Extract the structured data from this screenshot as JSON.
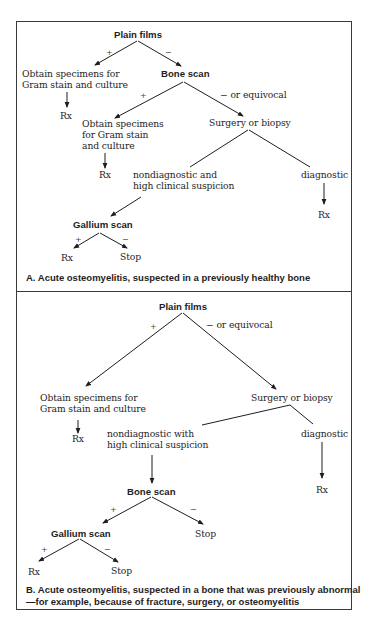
{
  "panel_a": {
    "root": "Plain films",
    "root_pos_label": "+",
    "root_neg_label": "−",
    "pos_result_line1": "Obtain specimens for",
    "pos_result_line2": "Gram stain and culture",
    "pos_rx": "Rx",
    "bone_scan": "Bone scan",
    "bone_pos_label": "+",
    "bone_neg_label": "−  or equivocal",
    "bone_pos_line1": "Obtain specimens",
    "bone_pos_line2": "for Gram stain",
    "bone_pos_line3": "and culture",
    "bone_pos_rx": "Rx",
    "surgery": "Surgery or biopsy",
    "nondiag_line1": "nondiagnostic and",
    "nondiag_line2": "high clinical suspicion",
    "diagnostic": "diagnostic",
    "diagnostic_rx": "Rx",
    "gallium": "Gallium scan",
    "gallium_pos_label": "+",
    "gallium_neg_label": "−",
    "gallium_rx": "Rx",
    "gallium_stop": "Stop",
    "caption": "A. Acute osteomyelitis, suspected in a previously healthy bone"
  },
  "panel_b": {
    "root": "Plain films",
    "root_pos_label": "+",
    "root_neg_label": "−  or equivocal",
    "pos_result_line1": "Obtain specimens for",
    "pos_result_line2": "Gram stain and culture",
    "pos_rx": "Rx",
    "surgery": "Surgery or biopsy",
    "nondiag_line1": "nondiagnostic with",
    "nondiag_line2": "high clinical suspicion",
    "diagnostic": "diagnostic",
    "diagnostic_rx": "Rx",
    "bone_scan": "Bone scan",
    "bone_pos_label": "+",
    "bone_neg_label": "−",
    "bone_stop": "Stop",
    "gallium": "Gallium scan",
    "gallium_pos_label": "+",
    "gallium_neg_label": "−",
    "gallium_rx": "Rx",
    "gallium_stop": "Stop",
    "caption_line1": "B. Acute osteomyelitis, suspected in a bone that was previously abnormal",
    "caption_line2": "—for example, because of fracture, surgery, or osteomyelitis"
  }
}
